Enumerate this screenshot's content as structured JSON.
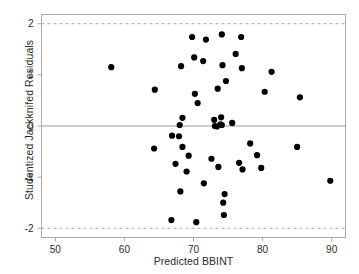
{
  "chart_data": {
    "type": "scatter",
    "title": "",
    "xlabel": "Predicted BBINT",
    "ylabel": "Studentized Jackknifed Residuals",
    "xlim": [
      48,
      92
    ],
    "ylim": [
      -2.18,
      2.18
    ],
    "xticks": [
      50,
      60,
      70,
      80,
      90
    ],
    "yticks": [
      2,
      1,
      0,
      -1,
      -2
    ],
    "xtick_labels": [
      "50",
      "60",
      "70",
      "80",
      "90"
    ],
    "ytick_labels": [
      "2",
      "1",
      "0",
      "-1",
      "-2"
    ],
    "grid": false,
    "legend": null,
    "marker_color": "#000000",
    "marker_size": 3.1,
    "frame_color": "#aaaaaa",
    "reference_lines": [
      {
        "name": "zero-line",
        "y": 0,
        "style": "solid",
        "color": "#9a9a9a"
      },
      {
        "name": "upper-bound-line",
        "y": 2,
        "style": "dashed",
        "color": "#a8a8a8"
      },
      {
        "name": "lower-bound-line",
        "y": -2,
        "style": "dashed",
        "color": "#a8a8a8"
      }
    ],
    "points": [
      {
        "x": 58.1,
        "y": 1.15
      },
      {
        "x": 64.4,
        "y": 0.71
      },
      {
        "x": 64.3,
        "y": -0.44
      },
      {
        "x": 66.8,
        "y": -1.84
      },
      {
        "x": 66.9,
        "y": -0.19
      },
      {
        "x": 67.4,
        "y": -0.74
      },
      {
        "x": 68.0,
        "y": 0.02
      },
      {
        "x": 67.9,
        "y": -0.2
      },
      {
        "x": 68.2,
        "y": 1.17
      },
      {
        "x": 68.4,
        "y": 0.16
      },
      {
        "x": 68.4,
        "y": -0.41
      },
      {
        "x": 68.1,
        "y": -1.28
      },
      {
        "x": 69.0,
        "y": -0.89
      },
      {
        "x": 69.3,
        "y": -0.58
      },
      {
        "x": 69.8,
        "y": 1.74
      },
      {
        "x": 70.1,
        "y": 1.34
      },
      {
        "x": 70.2,
        "y": 0.63
      },
      {
        "x": 70.4,
        "y": -1.88
      },
      {
        "x": 70.6,
        "y": 0.45
      },
      {
        "x": 71.4,
        "y": 1.27
      },
      {
        "x": 71.5,
        "y": -1.12
      },
      {
        "x": 71.8,
        "y": 1.69
      },
      {
        "x": 72.6,
        "y": -0.64
      },
      {
        "x": 73.0,
        "y": 0.12
      },
      {
        "x": 73.1,
        "y": 0.0
      },
      {
        "x": 73.4,
        "y": -0.01
      },
      {
        "x": 73.5,
        "y": 0.73
      },
      {
        "x": 73.6,
        "y": -0.8
      },
      {
        "x": 73.9,
        "y": 0.03
      },
      {
        "x": 74.0,
        "y": 0.17
      },
      {
        "x": 74.1,
        "y": 0.02
      },
      {
        "x": 74.1,
        "y": 1.79
      },
      {
        "x": 74.2,
        "y": 1.19
      },
      {
        "x": 74.3,
        "y": -1.5
      },
      {
        "x": 74.4,
        "y": -1.74
      },
      {
        "x": 74.5,
        "y": -1.33
      },
      {
        "x": 74.7,
        "y": 0.88
      },
      {
        "x": 75.6,
        "y": 0.06
      },
      {
        "x": 76.1,
        "y": 1.41
      },
      {
        "x": 76.6,
        "y": -0.72
      },
      {
        "x": 76.9,
        "y": 1.74
      },
      {
        "x": 77.0,
        "y": 1.13
      },
      {
        "x": 77.1,
        "y": -0.85
      },
      {
        "x": 78.2,
        "y": -0.34
      },
      {
        "x": 79.2,
        "y": -0.57
      },
      {
        "x": 79.8,
        "y": -0.82
      },
      {
        "x": 80.3,
        "y": 0.67
      },
      {
        "x": 81.3,
        "y": 1.06
      },
      {
        "x": 85.0,
        "y": -0.41
      },
      {
        "x": 85.4,
        "y": 0.56
      },
      {
        "x": 89.8,
        "y": -1.07
      }
    ]
  }
}
